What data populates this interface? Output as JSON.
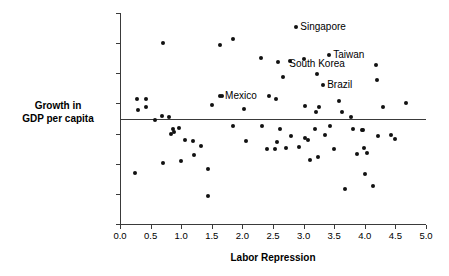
{
  "chart_data": {
    "type": "scatter",
    "title": "",
    "xlabel": "Labor Repression",
    "ylabel_line1": "Growth in",
    "ylabel_line2": "GDP per capita",
    "xlim": [
      0.0,
      5.0
    ],
    "ylim": [
      -4,
      10
    ],
    "grid": false,
    "legend": "none",
    "marker_color": "#111111",
    "axis_color": "#3a3a3a",
    "xticks": [
      "0.0",
      "0.5",
      "1.0",
      "1.5",
      "2.0",
      "2.5",
      "3.0",
      "3.5",
      "4.0",
      "4.5",
      "5.0"
    ],
    "xtick_values": [
      0.0,
      0.5,
      1.0,
      1.5,
      2.0,
      2.5,
      3.0,
      3.5,
      4.0,
      4.5,
      5.0
    ],
    "yticks": [
      "10",
      "8",
      "6",
      "4",
      "2",
      "0",
      "-2",
      "-4"
    ],
    "ytick_values": [
      10,
      8,
      6,
      4,
      2,
      0,
      -2,
      -4
    ],
    "reference_line": {
      "orientation": "horizontal",
      "y": 3.0
    },
    "points": [
      {
        "x": 0.24,
        "y": -0.62
      },
      {
        "x": 0.27,
        "y": 4.27
      },
      {
        "x": 0.29,
        "y": 3.58
      },
      {
        "x": 0.42,
        "y": 4.32
      },
      {
        "x": 0.43,
        "y": 3.78
      },
      {
        "x": 0.57,
        "y": 2.92
      },
      {
        "x": 0.68,
        "y": 3.18
      },
      {
        "x": 0.7,
        "y": 8.02
      },
      {
        "x": 0.71,
        "y": 0.05
      },
      {
        "x": 0.8,
        "y": 3.08
      },
      {
        "x": 0.84,
        "y": 1.98
      },
      {
        "x": 0.87,
        "y": 2.32
      },
      {
        "x": 0.88,
        "y": 2.1
      },
      {
        "x": 0.97,
        "y": 2.38
      },
      {
        "x": 1.0,
        "y": 0.2
      },
      {
        "x": 1.07,
        "y": 1.6
      },
      {
        "x": 1.2,
        "y": 1.48
      },
      {
        "x": 1.21,
        "y": 0.55
      },
      {
        "x": 1.33,
        "y": 1.15
      },
      {
        "x": 1.43,
        "y": -0.33
      },
      {
        "x": 1.44,
        "y": -2.17
      },
      {
        "x": 1.5,
        "y": 3.92
      },
      {
        "x": 1.63,
        "y": 7.85
      },
      {
        "x": 1.63,
        "y": 4.52
      },
      {
        "x": 1.67,
        "y": 4.52
      },
      {
        "x": 1.84,
        "y": 8.3
      },
      {
        "x": 1.85,
        "y": 2.48
      },
      {
        "x": 2.03,
        "y": 3.62
      },
      {
        "x": 2.06,
        "y": 1.5
      },
      {
        "x": 2.3,
        "y": 7.02
      },
      {
        "x": 2.32,
        "y": 2.52
      },
      {
        "x": 2.4,
        "y": 0.95
      },
      {
        "x": 2.44,
        "y": 4.5
      },
      {
        "x": 2.53,
        "y": 1.0
      },
      {
        "x": 2.55,
        "y": 4.3
      },
      {
        "x": 2.56,
        "y": 1.45
      },
      {
        "x": 2.58,
        "y": 6.78
      },
      {
        "x": 2.61,
        "y": 2.3
      },
      {
        "x": 2.67,
        "y": 5.75
      },
      {
        "x": 2.72,
        "y": 1.05
      },
      {
        "x": 2.78,
        "y": 6.82
      },
      {
        "x": 2.8,
        "y": 1.85
      },
      {
        "x": 2.88,
        "y": 9.05
      },
      {
        "x": 2.92,
        "y": 1.08
      },
      {
        "x": 3.0,
        "y": 6.98
      },
      {
        "x": 3.02,
        "y": 3.85
      },
      {
        "x": 3.03,
        "y": 1.7
      },
      {
        "x": 3.07,
        "y": 1.55
      },
      {
        "x": 3.1,
        "y": 0.22
      },
      {
        "x": 3.18,
        "y": 2.28
      },
      {
        "x": 3.2,
        "y": 3.43
      },
      {
        "x": 3.22,
        "y": 5.95
      },
      {
        "x": 3.23,
        "y": 0.42
      },
      {
        "x": 3.25,
        "y": 3.78
      },
      {
        "x": 3.32,
        "y": 5.2
      },
      {
        "x": 3.35,
        "y": 1.88
      },
      {
        "x": 3.42,
        "y": 7.2
      },
      {
        "x": 3.43,
        "y": 2.48
      },
      {
        "x": 3.5,
        "y": 1.0
      },
      {
        "x": 3.58,
        "y": 4.18
      },
      {
        "x": 3.62,
        "y": 3.42
      },
      {
        "x": 3.68,
        "y": -1.65
      },
      {
        "x": 3.78,
        "y": 3.1
      },
      {
        "x": 3.8,
        "y": 2.3
      },
      {
        "x": 3.88,
        "y": 0.65
      },
      {
        "x": 3.95,
        "y": 2.22
      },
      {
        "x": 3.97,
        "y": 2.25
      },
      {
        "x": 3.99,
        "y": 1.05
      },
      {
        "x": 4.0,
        "y": -0.7
      },
      {
        "x": 4.03,
        "y": 0.68
      },
      {
        "x": 4.13,
        "y": -1.5
      },
      {
        "x": 4.18,
        "y": 6.55
      },
      {
        "x": 4.2,
        "y": 5.58
      },
      {
        "x": 4.22,
        "y": 1.82
      },
      {
        "x": 4.3,
        "y": 3.78
      },
      {
        "x": 4.42,
        "y": 1.88
      },
      {
        "x": 4.5,
        "y": 1.62
      },
      {
        "x": 4.67,
        "y": 4.02
      }
    ],
    "annotations": [
      {
        "label": "Singapore",
        "x": 2.88,
        "y": 9.05,
        "anchor": "left"
      },
      {
        "label": "Taiwan",
        "x": 3.42,
        "y": 7.2,
        "anchor": "left"
      },
      {
        "label": "South Korea",
        "x": 3.22,
        "y": 6.6,
        "anchor": "center"
      },
      {
        "label": "Brazil",
        "x": 3.32,
        "y": 5.2,
        "anchor": "left"
      },
      {
        "label": "Mexico",
        "x": 2.3,
        "y": 4.52,
        "anchor": "right"
      }
    ]
  }
}
